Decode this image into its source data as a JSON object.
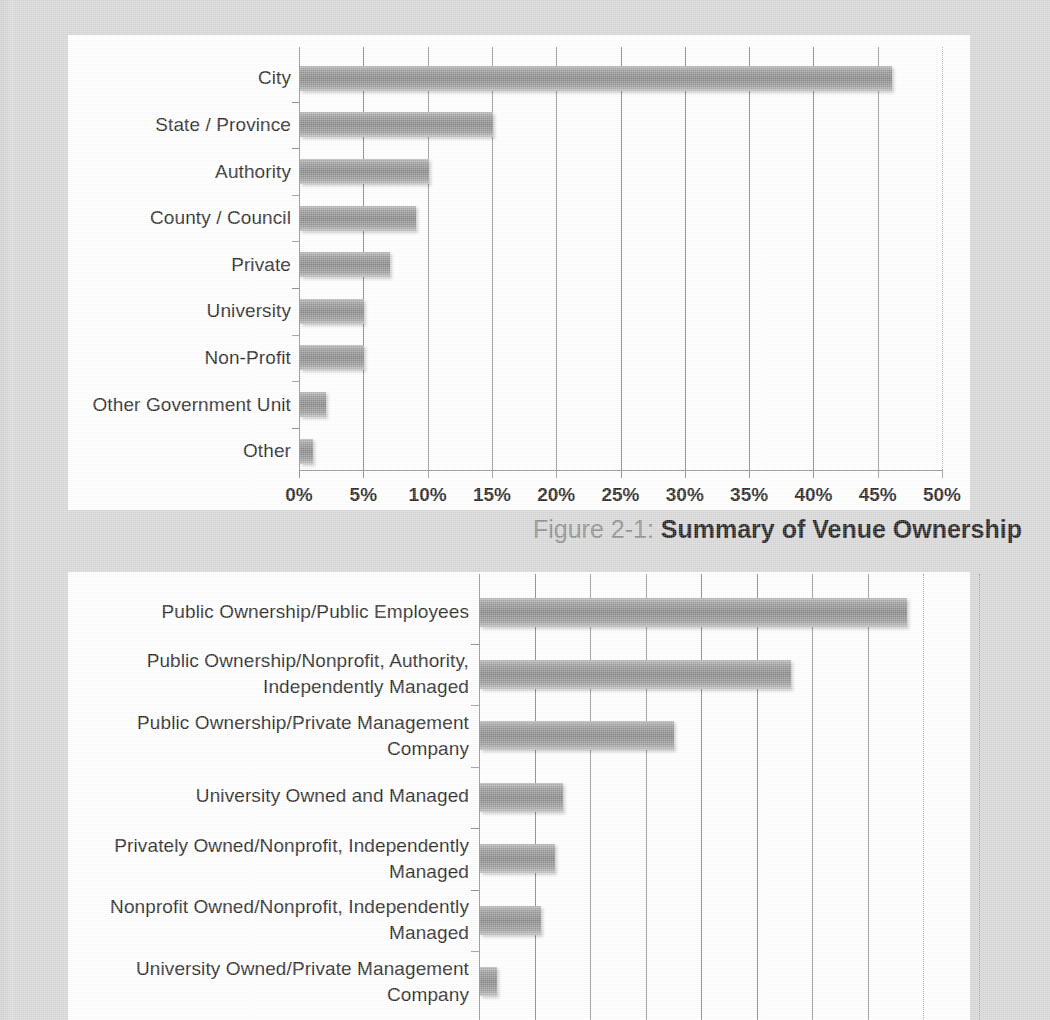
{
  "document": {
    "page_background": "#d6d6d6",
    "bar_color": "#8a8a8a"
  },
  "figure_one": {
    "caption_prefix": "Figure 2-1:",
    "caption_title": "Summary of Venue Ownership"
  },
  "chart_data": [
    {
      "type": "bar",
      "orientation": "horizontal",
      "title": "Summary of Venue Ownership",
      "figure_number": "Figure 2-1",
      "xlabel": "",
      "ylabel": "",
      "xlim": [
        0,
        50
      ],
      "xticks": [
        0,
        5,
        10,
        15,
        20,
        25,
        30,
        35,
        40,
        45,
        50
      ],
      "xtick_labels": [
        "0%",
        "5%",
        "10%",
        "15%",
        "20%",
        "25%",
        "30%",
        "35%",
        "40%",
        "45%",
        "50%"
      ],
      "grid": "vertical",
      "legend": "none",
      "categories": [
        "City",
        "State / Province",
        "Authority",
        "County / Council",
        "Private",
        "University",
        "Non-Profit",
        "Other Government Unit",
        "Other"
      ],
      "values": [
        46,
        15,
        10,
        9,
        7,
        5,
        5,
        2,
        1
      ],
      "value_unit": "%"
    },
    {
      "type": "bar",
      "orientation": "horizontal",
      "title": "",
      "xlabel": "",
      "ylabel": "",
      "xlim": [
        0,
        9
      ],
      "grid": "vertical",
      "legend": "none",
      "note": "x-axis tick labels are below the visible crop of the screenshot",
      "categories": [
        "Public Ownership/Public Employees",
        "Public Ownership/Nonprofit, Authority, Independently Managed",
        "Public Ownership/Private Management Company",
        "University Owned and Managed",
        "Privately Owned/Nonprofit, Independently Managed",
        "Nonprofit Owned/Nonprofit, Independently Managed",
        "University Owned/Private Management Company"
      ],
      "values": [
        7.7,
        5.6,
        3.5,
        1.5,
        1.35,
        1.1,
        0.3
      ],
      "value_unit": ""
    }
  ],
  "chart_one": {
    "axis": {
      "tick_labels": [
        "0%",
        "5%",
        "10%",
        "15%",
        "20%",
        "25%",
        "30%",
        "35%",
        "40%",
        "45%",
        "50%"
      ]
    },
    "bars": [
      {
        "label": "City",
        "value": 46
      },
      {
        "label": "State / Province",
        "value": 15
      },
      {
        "label": "Authority",
        "value": 10
      },
      {
        "label": "County / Council",
        "value": 9
      },
      {
        "label": "Private",
        "value": 7
      },
      {
        "label": "University",
        "value": 5
      },
      {
        "label": "Non-Profit",
        "value": 5
      },
      {
        "label": "Other Government Unit",
        "value": 2
      },
      {
        "label": "Other",
        "value": 1
      }
    ]
  },
  "chart_two": {
    "bars": [
      {
        "line1": "Public Ownership/Public Employees",
        "line2": "",
        "value": 7.7
      },
      {
        "line1": "Public Ownership/Nonprofit, Authority,",
        "line2": "Independently Managed",
        "value": 5.6
      },
      {
        "line1": "Public Ownership/Private Management",
        "line2": "Company",
        "value": 3.5
      },
      {
        "line1": "University Owned and Managed",
        "line2": "",
        "value": 1.5
      },
      {
        "line1": "Privately Owned/Nonprofit, Independently",
        "line2": "Managed",
        "value": 1.35
      },
      {
        "line1": "Nonprofit Owned/Nonprofit, Independently",
        "line2": "Managed",
        "value": 1.1
      },
      {
        "line1": "University Owned/Private Management",
        "line2": "Company",
        "value": 0.3
      }
    ]
  }
}
